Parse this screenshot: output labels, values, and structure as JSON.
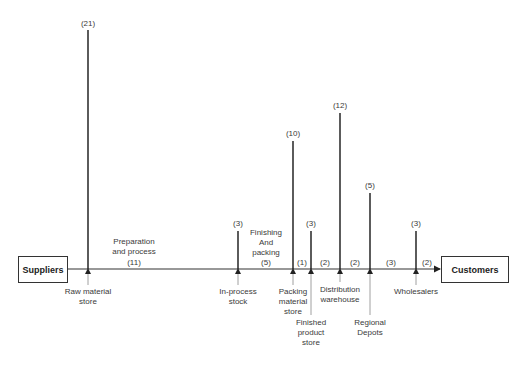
{
  "diagram": {
    "start_node": "Suppliers",
    "end_node": "Customers",
    "stages": [
      {
        "id": "raw-material-store",
        "label_lines": [
          "Raw material",
          "store"
        ],
        "height_value": "(21)"
      },
      {
        "id": "in-process-stock",
        "label_lines": [
          "In-process",
          "stock"
        ],
        "height_value": "(3)"
      },
      {
        "id": "packing-material-store",
        "label_lines": [
          "Packing",
          "material",
          "store"
        ],
        "height_value": "(10)"
      },
      {
        "id": "finished-product-store",
        "label_lines": [
          "Finished",
          "product",
          "store"
        ],
        "height_value": "(3)"
      },
      {
        "id": "distribution-warehouse",
        "label_lines": [
          "Distribution",
          "warehouse"
        ],
        "height_value": "(12)"
      },
      {
        "id": "regional-depots",
        "label_lines": [
          "Regional",
          "Depots"
        ],
        "height_value": "(5)"
      },
      {
        "id": "wholesalers",
        "label_lines": [
          "Wholesalers"
        ],
        "height_value": "(3)"
      }
    ],
    "segments": [
      {
        "label_lines": [
          "Preparation",
          "and process"
        ],
        "value": "(11)"
      },
      {
        "label_lines": [
          "Finishing",
          "And",
          "packing"
        ],
        "value": "(5)"
      },
      {
        "label_lines": [],
        "value": "(1)"
      },
      {
        "label_lines": [],
        "value": "(2)"
      },
      {
        "label_lines": [],
        "value": "(2)"
      },
      {
        "label_lines": [],
        "value": "(3)"
      },
      {
        "label_lines": [],
        "value": "(2)"
      }
    ]
  }
}
